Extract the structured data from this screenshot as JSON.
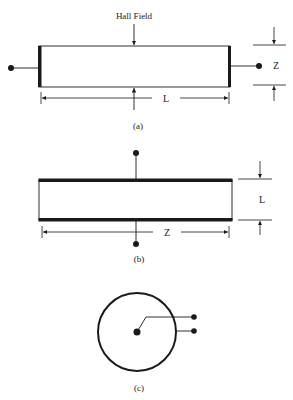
{
  "figure": {
    "panels": [
      {
        "id": "a",
        "caption": "(a)",
        "arrow_label": "Hall Field",
        "length_label": "L",
        "thickness_label": "Z",
        "description": "Bar with electrodes at the two short ends; Hall field transverse"
      },
      {
        "id": "b",
        "caption": "(b)",
        "length_label": "Z",
        "thickness_label": "L",
        "description": "Bar with electrodes on the two long faces"
      },
      {
        "id": "c",
        "caption": "(c)",
        "description": "Circular (Corbino) geometry with center contact and outer ring contact"
      }
    ]
  },
  "colors": {
    "ink": "#1a1a1a",
    "background": "#ffffff"
  }
}
